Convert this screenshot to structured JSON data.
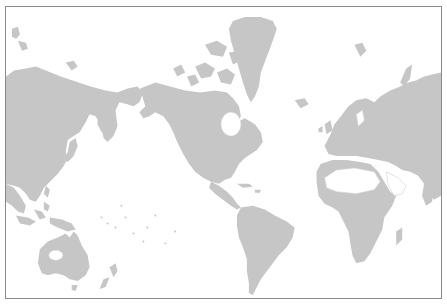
{
  "caption": {
    "text": ""
  },
  "map": {
    "projection": "mercator",
    "center": "pacific",
    "land_color": "#c6c6c6",
    "water_color": "#ffffff",
    "border_color": "#8a8a8a",
    "regions": [
      "asia",
      "russia",
      "alaska",
      "canada",
      "greenland",
      "usa",
      "central-america",
      "south-america",
      "europe",
      "scandinavia",
      "africa",
      "madagascar",
      "australia",
      "new-zealand",
      "indonesia",
      "japan",
      "svalbard",
      "novaya-zemlya"
    ]
  }
}
